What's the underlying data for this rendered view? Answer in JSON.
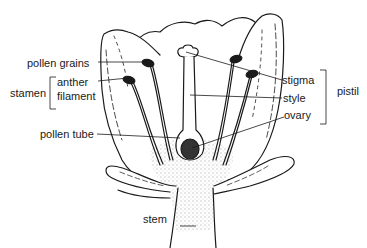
{
  "diagram": {
    "labels": {
      "pollen_grains": "pollen grains",
      "stamen": "stamen",
      "anther": "anther",
      "filament": "filament",
      "pollen_tube": "pollen tube",
      "stigma": "stigma",
      "style": "style",
      "ovary": "ovary",
      "pistil": "pistil",
      "stem": "stem"
    },
    "colors": {
      "ink": "#1a1a1a",
      "background": "#ffffff"
    }
  }
}
